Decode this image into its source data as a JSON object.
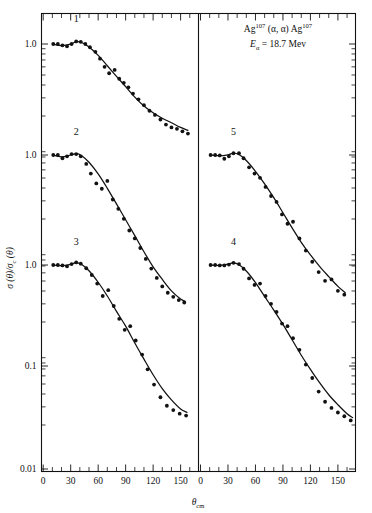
{
  "figure": {
    "annotation": {
      "line1_prefix": "Ag",
      "line1_sup1": "107",
      "line1_mid": " (α, α) Ag",
      "line1_sup2": "107",
      "line2_symbol": "E",
      "line2_sub": "α",
      "line2_rest": " = 18.7 Mev"
    },
    "y_axis": {
      "label_sigma": "σ (θ)/σ",
      "label_sub": "c",
      "label_tail": " (θ)",
      "tick_labels": [
        "1.0",
        "1.0",
        "1.0",
        "0.1",
        "0.01"
      ],
      "decade_px": 103
    },
    "x_axis": {
      "label_main": "θ",
      "label_sub": "cm",
      "tick_labels": [
        "0",
        "30",
        "60",
        "90",
        "120",
        "150"
      ],
      "tick_values": [
        0,
        30,
        60,
        90,
        120,
        150
      ],
      "minor_step": 10,
      "range": [
        0,
        172
      ]
    },
    "curve_labels": [
      "1",
      "2",
      "3",
      "4",
      "5"
    ],
    "colors": {
      "ink": "#111111",
      "background": "#ffffff"
    }
  },
  "chart_data": {
    "type": "scatter",
    "title": "Ag107 (α, α) Ag107  Eα = 18.7 Mev",
    "xlabel": "θ_cm",
    "ylabel": "σ(θ)/σ_c(θ)",
    "xlim": [
      0,
      172
    ],
    "ylim_decades": 5,
    "yscale": "log",
    "grid": false,
    "legend": "inline-curve-numbers",
    "panels": [
      {
        "panel": "left",
        "xlim": [
          0,
          172
        ],
        "series": [
          {
            "name": "1",
            "label": "1",
            "baseline_value": 1.0,
            "points_x": [
              11,
              16,
              21,
              26,
              31,
              36,
              41,
              46,
              51,
              57,
              62,
              67,
              72,
              78,
              83,
              88,
              93,
              98,
              104,
              110,
              116,
              122,
              128,
              134,
              140,
              146,
              152,
              158
            ],
            "points_y": [
              1.0,
              1.0,
              0.97,
              0.95,
              1.0,
              1.06,
              1.05,
              1.0,
              0.93,
              0.84,
              0.72,
              0.6,
              0.52,
              0.56,
              0.46,
              0.42,
              0.38,
              0.33,
              0.29,
              0.255,
              0.225,
              0.205,
              0.185,
              0.165,
              0.155,
              0.15,
              0.142,
              0.135
            ],
            "curve_x": [
              10,
              20,
              30,
              36,
              42,
              50,
              60,
              70,
              80,
              90,
              100,
              110,
              120,
              130,
              140,
              150,
              158
            ],
            "curve_y": [
              1.0,
              0.965,
              0.995,
              1.055,
              1.035,
              0.935,
              0.775,
              0.615,
              0.485,
              0.385,
              0.305,
              0.25,
              0.215,
              0.19,
              0.172,
              0.155,
              0.145
            ]
          },
          {
            "name": "2",
            "label": "2",
            "baseline_value": 1.0,
            "points_x": [
              11,
              16,
              21,
              26,
              31,
              36,
              41,
              47,
              52,
              58,
              64,
              70,
              76,
              82,
              88,
              94,
              100,
              106,
              112,
              118,
              124,
              130,
              136,
              142,
              148,
              154
            ],
            "points_y": [
              1.0,
              1.0,
              0.93,
              0.97,
              1.02,
              1.02,
              0.97,
              0.82,
              0.66,
              0.53,
              0.47,
              0.56,
              0.37,
              0.3,
              0.24,
              0.185,
              0.155,
              0.125,
              0.098,
              0.079,
              0.064,
              0.053,
              0.046,
              0.042,
              0.039,
              0.037
            ],
            "curve_x": [
              10,
              20,
              30,
              36,
              42,
              50,
              60,
              70,
              80,
              90,
              100,
              110,
              120,
              130,
              140,
              150,
              155
            ],
            "curve_y": [
              1.0,
              0.96,
              1.0,
              1.03,
              0.985,
              0.85,
              0.655,
              0.475,
              0.335,
              0.235,
              0.165,
              0.115,
              0.082,
              0.062,
              0.048,
              0.04,
              0.038
            ]
          },
          {
            "name": "3",
            "label": "3",
            "baseline_value": 1.0,
            "points_x": [
              11,
              16,
              21,
              26,
              31,
              36,
              41,
              47,
              53,
              59,
              65,
              71,
              77,
              83,
              89,
              95,
              101,
              108,
              114,
              121,
              128,
              135,
              142,
              149,
              156
            ],
            "points_y": [
              1.0,
              1.0,
              0.99,
              0.97,
              1.02,
              1.06,
              1.03,
              0.93,
              0.8,
              0.66,
              0.5,
              0.57,
              0.4,
              0.3,
              0.235,
              0.255,
              0.185,
              0.135,
              0.097,
              0.069,
              0.052,
              0.043,
              0.039,
              0.036,
              0.0345
            ],
            "curve_x": [
              10,
              20,
              30,
              36,
              42,
              50,
              60,
              70,
              80,
              90,
              100,
              110,
              120,
              130,
              140,
              150,
              157
            ],
            "curve_y": [
              1.0,
              0.985,
              1.015,
              1.055,
              1.01,
              0.88,
              0.68,
              0.5,
              0.355,
              0.255,
              0.175,
              0.122,
              0.086,
              0.063,
              0.049,
              0.04,
              0.037
            ]
          }
        ]
      },
      {
        "panel": "right",
        "xlim": [
          0,
          172
        ],
        "series": [
          {
            "name": "5",
            "label": "5",
            "baseline_value": 1.0,
            "points_x": [
              11,
              16,
              21,
              26,
              31,
              36,
              42,
              47,
              53,
              59,
              65,
              71,
              77,
              83,
              89,
              95,
              101,
              108,
              115,
              122,
              129,
              136,
              143,
              150,
              157
            ],
            "points_y": [
              1.0,
              1.0,
              0.99,
              0.92,
              0.97,
              1.04,
              1.04,
              0.93,
              0.76,
              0.66,
              0.6,
              0.49,
              0.4,
              0.35,
              0.265,
              0.215,
              0.225,
              0.155,
              0.118,
              0.092,
              0.073,
              0.06,
              0.062,
              0.048,
              0.044
            ],
            "curve_x": [
              10,
              20,
              30,
              36,
              42,
              50,
              60,
              70,
              80,
              90,
              100,
              110,
              120,
              130,
              140,
              150,
              158
            ],
            "curve_y": [
              1.0,
              0.985,
              1.005,
              1.045,
              1.01,
              0.885,
              0.695,
              0.525,
              0.385,
              0.275,
              0.196,
              0.142,
              0.107,
              0.083,
              0.066,
              0.053,
              0.046
            ]
          },
          {
            "name": "4",
            "label": "4",
            "baseline_value": 1.0,
            "points_x": [
              11,
              16,
              21,
              26,
              31,
              36,
              42,
              47,
              53,
              59,
              65,
              71,
              77,
              83,
              89,
              95,
              101,
              108,
              115,
              122,
              129,
              136,
              143,
              150,
              157,
              164
            ],
            "points_y": [
              1.0,
              1.0,
              0.99,
              0.99,
              1.01,
              1.05,
              1.02,
              0.92,
              0.74,
              0.64,
              0.66,
              0.5,
              0.42,
              0.35,
              0.27,
              0.255,
              0.195,
              0.15,
              0.108,
              0.08,
              0.059,
              0.047,
              0.041,
              0.037,
              0.034,
              0.031
            ],
            "curve_x": [
              10,
              20,
              30,
              36,
              42,
              50,
              60,
              70,
              80,
              90,
              100,
              110,
              120,
              130,
              140,
              150,
              160,
              166
            ],
            "curve_y": [
              1.0,
              0.99,
              1.02,
              1.05,
              1.005,
              0.875,
              0.675,
              0.495,
              0.365,
              0.265,
              0.188,
              0.133,
              0.097,
              0.072,
              0.055,
              0.044,
              0.036,
              0.033
            ]
          }
        ]
      }
    ]
  }
}
